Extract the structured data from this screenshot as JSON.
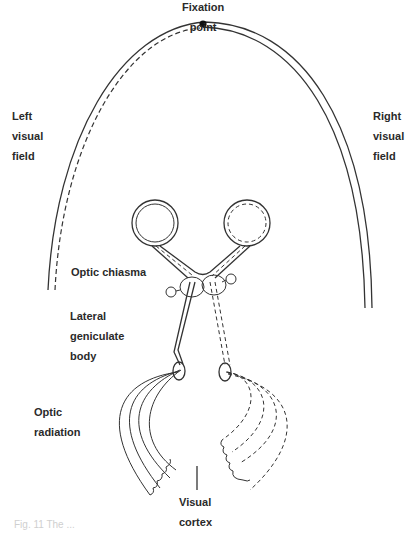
{
  "labels": {
    "fixation_point": "Fixation\npoint",
    "left_visual_field": "Left\nvisual\nfield",
    "right_visual_field": "Right\nvisual\nfield",
    "optic_chiasma": "Optic chiasma",
    "lateral_geniculate_body": "Lateral\ngeniculate\nbody",
    "optic_radiation": "Optic\nradiation",
    "visual_cortex": "Visual\ncortex"
  },
  "caption": "Fig. 11 The ...",
  "colors": {
    "line": "#333333",
    "text": "#2a2a2a",
    "background": "#ffffff"
  }
}
